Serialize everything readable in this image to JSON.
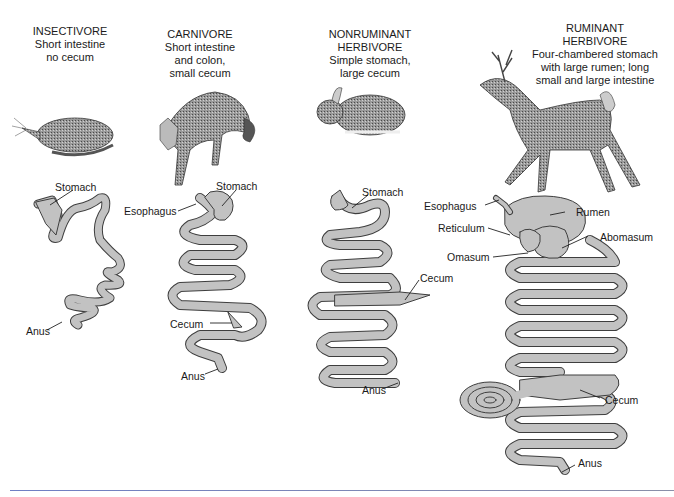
{
  "colors": {
    "gut_fill": "#c2c2c2",
    "gut_outline": "#4a4a4a",
    "animal": "#6e6e6e",
    "rule": "#7a86c0"
  },
  "panels": [
    {
      "heading": "INSECTIVORE",
      "description": [
        "Short intestine",
        "no cecum"
      ],
      "animal": "shrew",
      "labels": {
        "stomach": "Stomach",
        "anus": "Anus"
      }
    },
    {
      "heading": "CARNIVORE",
      "description": [
        "Short intestine",
        "and colon,",
        "small cecum"
      ],
      "animal": "fox",
      "labels": {
        "stomach": "Stomach",
        "esophagus": "Esophagus",
        "cecum": "Cecum",
        "anus": "Anus"
      }
    },
    {
      "heading": [
        "NONRUMINANT",
        "HERBIVORE"
      ],
      "description": [
        "Simple stomach,",
        "large cecum"
      ],
      "animal": "rabbit",
      "labels": {
        "stomach": "Stomach",
        "cecum": "Cecum",
        "anus": "Anus"
      }
    },
    {
      "heading": [
        "RUMINANT",
        "HERBIVORE"
      ],
      "description": [
        "Four-chambered stomach",
        "with large rumen; long",
        "small and large intestine"
      ],
      "animal": "deer",
      "labels": {
        "esophagus": "Esophagus",
        "rumen": "Rumen",
        "reticulum": "Reticulum",
        "abomasum": "Abomasum",
        "omasum": "Omasum",
        "cecum": "Cecum",
        "anus": "Anus"
      }
    }
  ]
}
